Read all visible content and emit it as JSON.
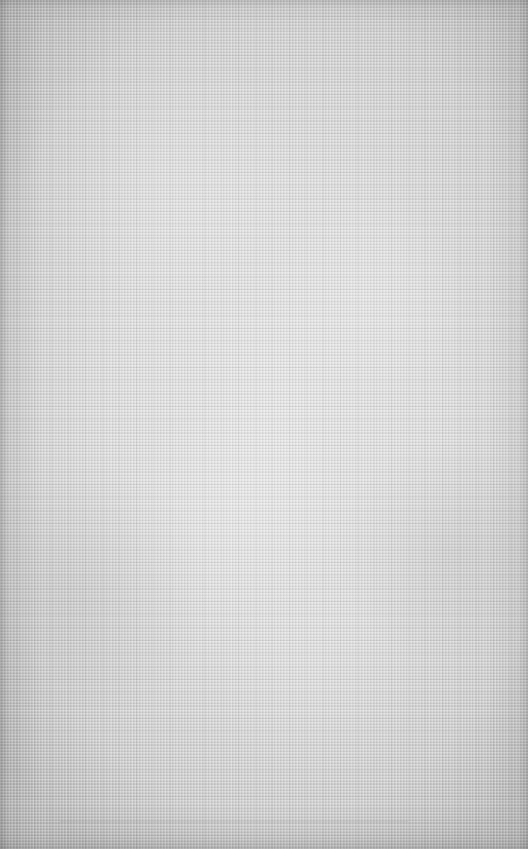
{
  "background": {
    "texture": "linen-canvas",
    "colors": {
      "center": "#e6e6e6",
      "mid": "#d9d9d9",
      "edge": "#bcbcbc"
    }
  }
}
